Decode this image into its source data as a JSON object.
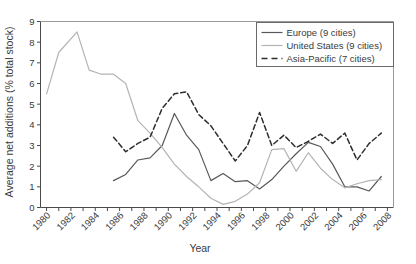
{
  "chart_data": {
    "type": "line",
    "title": "",
    "xlabel": "Year",
    "ylabel": "Average net additions (% total stock)",
    "xlim": [
      1979.5,
      2008.5
    ],
    "ylim": [
      0,
      9
    ],
    "yticks": [
      0,
      1,
      2,
      3,
      4,
      5,
      6,
      7,
      8,
      9
    ],
    "xticks": [
      1980,
      1982,
      1984,
      1986,
      1988,
      1990,
      1992,
      1994,
      1996,
      1998,
      2000,
      2002,
      2004,
      2006,
      2008
    ],
    "xtick_labels": [
      "1980",
      "1982",
      "1984",
      "1986",
      "1988",
      "1990",
      "1992",
      "1994",
      "1996",
      "1998",
      "2000",
      "2002",
      "2004",
      "2006",
      "2008"
    ],
    "ytick_labels": [
      "0",
      "1",
      "2",
      "3",
      "4",
      "5",
      "6",
      "7",
      "8",
      "9"
    ],
    "grid": false,
    "legend_position": "top-right",
    "series": [
      {
        "name": "Europe (9 cities)",
        "color": "#58585a",
        "style": "solid",
        "x": [
          1985.5,
          1986.5,
          1987.5,
          1988.5,
          1989.5,
          1990.5,
          1991.5,
          1992.5,
          1993.5,
          1994.5,
          1995.5,
          1996.5,
          1997.5,
          1998.5,
          1999.5,
          2000.5,
          2001.5,
          2002.5,
          2003.5,
          2004.5,
          2005.5,
          2006.5,
          2007.5
        ],
        "values": [
          1.3,
          1.6,
          2.3,
          2.4,
          3.0,
          4.55,
          3.5,
          2.8,
          1.3,
          1.65,
          1.25,
          1.3,
          0.9,
          1.35,
          2.0,
          2.6,
          3.15,
          2.95,
          2.1,
          1.0,
          1.0,
          0.8,
          1.5
        ]
      },
      {
        "name": "United States  (9 cities)",
        "color": "#b4b4b4",
        "style": "solid",
        "x": [
          1980.0,
          1981.0,
          1982.5,
          1983.5,
          1984.5,
          1985.5,
          1986.5,
          1987.5,
          1988.5,
          1989.5,
          1990.5,
          1991.5,
          1992.5,
          1993.5,
          1994.5,
          1995.5,
          1996.5,
          1997.5,
          1998.5,
          1999.5,
          2000.5,
          2001.5,
          2002.5,
          2003.5,
          2004.5,
          2005.5,
          2006.5,
          2007.5
        ],
        "values": [
          5.5,
          7.5,
          8.5,
          6.65,
          6.45,
          6.45,
          6.0,
          4.2,
          3.6,
          2.9,
          2.1,
          1.5,
          1.0,
          0.45,
          0.15,
          0.3,
          0.65,
          1.2,
          2.8,
          2.85,
          1.75,
          2.65,
          1.9,
          1.35,
          0.95,
          1.15,
          1.3,
          1.35
        ]
      },
      {
        "name": "Asia-Pacific (7 cities)",
        "color": "#2e2e2e",
        "style": "dashed",
        "x": [
          1985.5,
          1986.5,
          1987.5,
          1988.5,
          1989.5,
          1990.5,
          1991.5,
          1992.5,
          1993.5,
          1994.5,
          1995.5,
          1996.5,
          1997.5,
          1998.5,
          1999.5,
          2000.5,
          2001.5,
          2002.5,
          2003.5,
          2004.5,
          2005.5,
          2006.5,
          2007.5
        ],
        "values": [
          3.4,
          2.7,
          3.1,
          3.4,
          4.8,
          5.5,
          5.6,
          4.5,
          3.95,
          3.1,
          2.25,
          3.0,
          4.6,
          3.0,
          3.5,
          2.9,
          3.2,
          3.55,
          3.1,
          3.6,
          2.3,
          3.1,
          3.6
        ]
      }
    ]
  },
  "legend": {
    "entries": [
      {
        "label": "Europe (9 cities)"
      },
      {
        "label": "United States  (9 cities)"
      },
      {
        "label": "Asia-Pacific (7 cities)"
      }
    ]
  },
  "axes": {
    "y_title": "Average net additions (% total stock)",
    "x_title": "Year"
  }
}
